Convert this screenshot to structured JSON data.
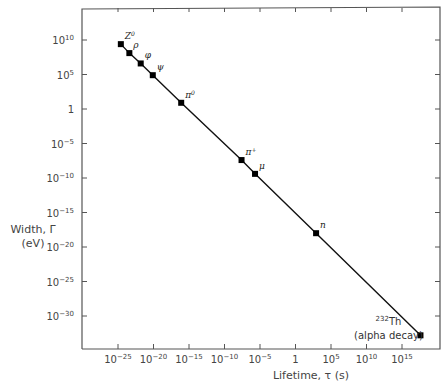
{
  "chart_data": {
    "type": "line",
    "title": "",
    "xlabel": "Lifetime, τ (s)",
    "ylabel": "Width, Γ (eV)",
    "ylabel_line1": "Width, Γ",
    "ylabel_line2": "(eV)",
    "xscale": "log",
    "yscale": "log",
    "xlim_exp": [
      -30,
      20
    ],
    "ylim_exp": [
      -35,
      13
    ],
    "grid": false,
    "legend": null,
    "x_ticks": [
      {
        "exp": -25,
        "base": "10",
        "sup": "−25"
      },
      {
        "exp": -20,
        "base": "10",
        "sup": "−20"
      },
      {
        "exp": -15,
        "base": "10",
        "sup": "−15"
      },
      {
        "exp": -10,
        "base": "10",
        "sup": "−10"
      },
      {
        "exp": -5,
        "base": "10",
        "sup": "−5"
      },
      {
        "exp": 0,
        "base": "1",
        "sup": ""
      },
      {
        "exp": 5,
        "base": "10",
        "sup": "5"
      },
      {
        "exp": 10,
        "base": "10",
        "sup": "10"
      },
      {
        "exp": 15,
        "base": "10",
        "sup": "15"
      }
    ],
    "y_ticks": [
      {
        "exp": 10,
        "base": "10",
        "sup": "10"
      },
      {
        "exp": 5,
        "base": "10",
        "sup": "5"
      },
      {
        "exp": 0,
        "base": "1",
        "sup": ""
      },
      {
        "exp": -5,
        "base": "10",
        "sup": "−5"
      },
      {
        "exp": -10,
        "base": "10",
        "sup": "−10"
      },
      {
        "exp": -15,
        "base": "10",
        "sup": "−15"
      },
      {
        "exp": -20,
        "base": "10",
        "sup": "−20"
      },
      {
        "exp": -25,
        "base": "10",
        "sup": "−25"
      },
      {
        "exp": -30,
        "base": "10",
        "sup": "−30"
      }
    ],
    "series": [
      {
        "name": "Γ = ħ/τ",
        "points": [
          {
            "label": "Z",
            "sup": "0",
            "log_tau": -24.6,
            "log_gamma": 9.4
          },
          {
            "label": "ρ",
            "sup": "",
            "log_tau": -23.4,
            "log_gamma": 8.1
          },
          {
            "label": "φ",
            "sup": "",
            "log_tau": -21.8,
            "log_gamma": 6.6
          },
          {
            "label": "ψ",
            "sup": "",
            "log_tau": -20.1,
            "log_gamma": 4.9
          },
          {
            "label": "π",
            "sup": "0",
            "log_tau": -16.1,
            "log_gamma": 0.9
          },
          {
            "label": "π",
            "sup": "+",
            "log_tau": -7.6,
            "log_gamma": -7.4
          },
          {
            "label": "μ",
            "sup": "",
            "log_tau": -5.7,
            "log_gamma": -9.4
          },
          {
            "label": "n",
            "sup": "",
            "log_tau": 2.9,
            "log_gamma": -18.0
          },
          {
            "label": "Th",
            "sup": "232",
            "note": "(alpha decay)",
            "log_tau": 17.6,
            "log_gamma": -32.8
          }
        ]
      }
    ]
  }
}
